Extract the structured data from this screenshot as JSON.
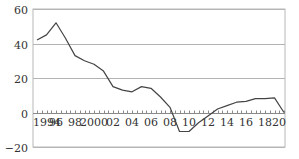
{
  "chart_data": {
    "type": "line",
    "title": "",
    "xlabel": "",
    "ylabel": "",
    "ylim": [
      -20,
      60
    ],
    "xlim": [
      1993.6,
      2020
    ],
    "yticks": [
      60,
      40,
      20,
      0,
      -20
    ],
    "ytick_labels": [
      "60",
      "40",
      "20",
      "0",
      "−20"
    ],
    "xtick_positions": [
      1994,
      1996,
      1998,
      2000,
      2002,
      2004,
      2006,
      2008,
      2010,
      2012,
      2014,
      2016,
      2018,
      2020
    ],
    "xtick_labels": [
      "1994",
      "96",
      "98",
      "2000",
      "02",
      "04",
      "06",
      "08",
      "10",
      "12",
      "14",
      "16",
      "18",
      "20"
    ],
    "grid": true,
    "legend": "none",
    "x": [
      1994,
      1995,
      1996,
      1997,
      1998,
      1999,
      2000,
      2001,
      2002,
      2003,
      2004,
      2005,
      2006,
      2007,
      2008,
      2009,
      2010,
      2011,
      2012,
      2013,
      2014,
      2015,
      2016,
      2017,
      2018,
      2019,
      2020
    ],
    "series": [
      {
        "name": "series",
        "values": [
          42,
          45,
          52,
          43,
          33,
          30,
          28,
          24,
          15,
          13,
          12,
          15,
          14,
          9,
          3,
          -11,
          -11,
          -6,
          -2,
          2,
          4,
          6,
          6.5,
          8,
          8,
          8.5,
          0
        ]
      }
    ]
  },
  "colors": {
    "line": "#444444",
    "grid": "#b3b3b3",
    "text": "#333333"
  }
}
